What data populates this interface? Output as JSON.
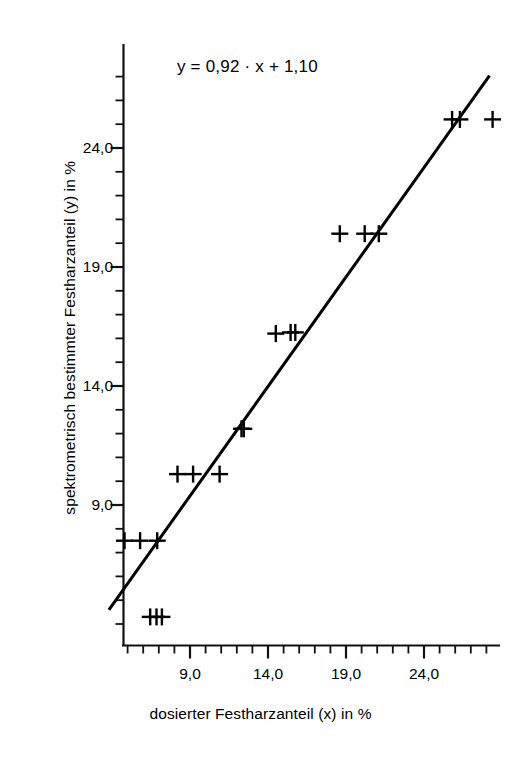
{
  "figure": {
    "background": "#ffffff",
    "ink_color": "#000000",
    "annotation": "y = 0,92 · x + 1,10"
  },
  "chart_data": {
    "type": "scatter",
    "title": "",
    "annotation": "y = 0,92 · x + 1,10",
    "xlabel": "dosierter Festharzanteil (x) in %",
    "ylabel": "spektrometrisch bestimmter Festharzanteil (y) in %",
    "xlim": [
      3.2,
      29.2
    ],
    "ylim": [
      3.0,
      27.0
    ],
    "xticks": [
      9.0,
      14.0,
      19.0,
      24.0
    ],
    "yticks": [
      9.0,
      14.0,
      19.0,
      24.0
    ],
    "xtick_labels": [
      "9,0",
      "14,0",
      "19,0",
      "24,0"
    ],
    "ytick_labels": [
      "9,0",
      "14,0",
      "19,0",
      "24,0"
    ],
    "minor_tick_step": 1.0,
    "grid": false,
    "legend": null,
    "marker": "plus",
    "points": [
      {
        "x": 6.45,
        "y": 4.3
      },
      {
        "x": 6.85,
        "y": 4.3
      },
      {
        "x": 7.2,
        "y": 4.3
      },
      {
        "x": 4.8,
        "y": 7.5
      },
      {
        "x": 5.8,
        "y": 7.5
      },
      {
        "x": 6.9,
        "y": 7.5
      },
      {
        "x": 8.2,
        "y": 10.3
      },
      {
        "x": 9.2,
        "y": 10.3
      },
      {
        "x": 10.9,
        "y": 10.3
      },
      {
        "x": 12.3,
        "y": 12.2
      },
      {
        "x": 12.45,
        "y": 12.2
      },
      {
        "x": 14.5,
        "y": 16.2
      },
      {
        "x": 15.45,
        "y": 16.25
      },
      {
        "x": 15.75,
        "y": 16.25
      },
      {
        "x": 18.6,
        "y": 20.4
      },
      {
        "x": 20.2,
        "y": 20.4
      },
      {
        "x": 21.1,
        "y": 20.4
      },
      {
        "x": 25.8,
        "y": 25.2
      },
      {
        "x": 26.3,
        "y": 25.2
      },
      {
        "x": 28.4,
        "y": 25.2
      }
    ],
    "fit_line": {
      "slope": 0.92,
      "intercept": 1.1,
      "x_start": 3.8,
      "x_end": 28.2,
      "equation": "y = 0,92 · x + 1,10"
    }
  },
  "axes": {
    "x_title": "dosierter Festharzanteil (x) in %",
    "y_title": "spektrometrisch bestimmter Festharzanteil (y) in %",
    "x_labels": [
      "9,0",
      "14,0",
      "19,0",
      "24,0"
    ],
    "y_labels": [
      "9,0",
      "14,0",
      "19,0",
      "24,0"
    ]
  }
}
